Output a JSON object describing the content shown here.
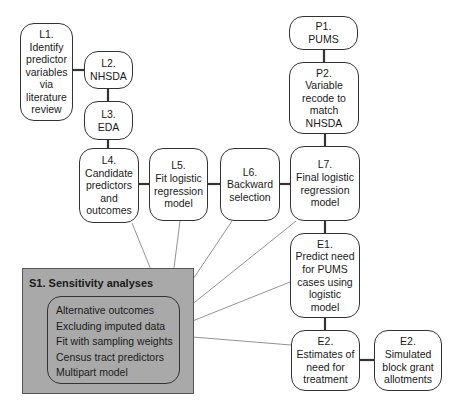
{
  "nodes": {
    "L1": {
      "id": "L1.",
      "text": "Identify predictor variables via literature review"
    },
    "L2": {
      "id": "L2.",
      "text": "NHSDA"
    },
    "L3": {
      "id": "L3.",
      "text": "EDA"
    },
    "L4": {
      "id": "L4.",
      "text": "Candidate predictors and outcomes"
    },
    "L5": {
      "id": "L5.",
      "text": "Fit logistic regression model"
    },
    "L6": {
      "id": "L6.",
      "text": "Backward selection"
    },
    "L7": {
      "id": "L7.",
      "text": "Final logistic regression model"
    },
    "P1": {
      "id": "P1.",
      "text": "PUMS"
    },
    "P2": {
      "id": "P2.",
      "text": "Variable recode to match NHSDA"
    },
    "E1": {
      "id": "E1.",
      "text": "Predict need for PUMS cases using logistic model"
    },
    "E2": {
      "id": "E2.",
      "text": "Estimates of need for treatment"
    },
    "E2b": {
      "id": "E2.",
      "text": "Simulated block grant allotments"
    }
  },
  "sensitivity": {
    "title": "S1.  Sensitivity analyses",
    "items": [
      "Alternative outcomes",
      "Excluding imputed data",
      "Fit with sampling weights",
      "Census tract predictors",
      "Multipart model"
    ]
  },
  "edges": [
    [
      "L1",
      "L2"
    ],
    [
      "L2",
      "L3"
    ],
    [
      "L3",
      "L4"
    ],
    [
      "L4",
      "L5"
    ],
    [
      "L5",
      "L6"
    ],
    [
      "L6",
      "L7"
    ],
    [
      "P1",
      "P2"
    ],
    [
      "P2",
      "L7"
    ],
    [
      "L7",
      "E1"
    ],
    [
      "E1",
      "E2"
    ],
    [
      "E2",
      "E2b"
    ],
    [
      "S1",
      "L4"
    ],
    [
      "S1",
      "L5"
    ],
    [
      "S1",
      "L6"
    ],
    [
      "S1",
      "L7"
    ],
    [
      "S1",
      "E1"
    ],
    [
      "S1",
      "E2"
    ]
  ],
  "colors": {
    "line": "#333333",
    "s1_fill": "#a9a9a9",
    "thin_line": "#666666"
  }
}
